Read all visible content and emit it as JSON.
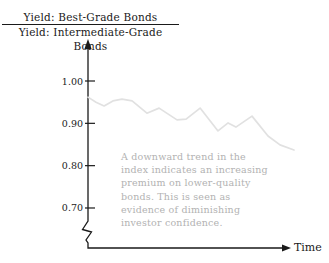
{
  "title": {
    "numerator": "Yield: Best-Grade Bonds",
    "denominator": "Yield: Intermediate-Grade Bonds"
  },
  "axes": {
    "x_label": "Time"
  },
  "annotation": {
    "text": "A downward trend in the\nindex indicates an increasing\npremium on lower-quality\nbonds. This is seen as\nevidence of diminishing\ninvestor confidence."
  },
  "colors": {
    "axis": "#1a1a1a",
    "data_line": "#e1e1e1",
    "annotation_text": "#b2b2b2"
  },
  "chart_data": {
    "type": "line",
    "xlabel": "Time",
    "ylabel": "Yield ratio index",
    "yticks": [
      {
        "value": 1.0,
        "label": "1.00"
      },
      {
        "value": 0.9,
        "label": "0.90"
      },
      {
        "value": 0.8,
        "label": "0.80"
      },
      {
        "value": 0.7,
        "label": "0.70"
      }
    ],
    "ylim": [
      0.65,
      1.05
    ],
    "xlim": [
      0,
      100
    ],
    "axis_break": true,
    "grid": false,
    "legend": "none",
    "series": [
      {
        "name": "yield-ratio-index",
        "x": [
          0,
          3.9,
          7.8,
          12.1,
          16.5,
          21.4,
          28.6,
          34.5,
          43.2,
          47.6,
          54.4,
          63.1,
          68.0,
          71.8,
          79.6,
          87.4,
          93.2,
          100
        ],
        "values": [
          0.962,
          0.95,
          0.941,
          0.953,
          0.957,
          0.953,
          0.924,
          0.936,
          0.908,
          0.91,
          0.936,
          0.882,
          0.901,
          0.891,
          0.917,
          0.87,
          0.849,
          0.837
        ]
      }
    ]
  }
}
